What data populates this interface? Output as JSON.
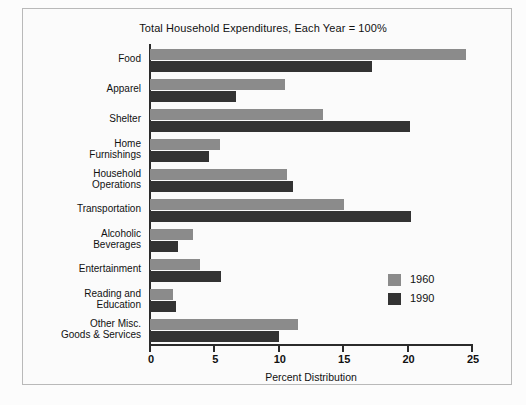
{
  "chart_data": {
    "type": "bar",
    "orientation": "horizontal",
    "title": "Total Household Expenditures, Each Year = 100%",
    "xlabel": "Percent Distribution",
    "ylabel": "",
    "xlim": [
      0,
      25
    ],
    "xticks": [
      0,
      5,
      10,
      15,
      20,
      25
    ],
    "xtick_labels": [
      "0",
      "5",
      "10",
      "15",
      "20",
      "25"
    ],
    "grid": false,
    "legend_position": "center-right",
    "categories": [
      "Food",
      "Apparel",
      "Shelter",
      "Home Furnishings",
      "Household Operations",
      "Transportation",
      "Alcoholic Beverages",
      "Entertainment",
      "Reading and Education",
      "Other Misc. Goods & Services"
    ],
    "category_lines": [
      [
        "Food"
      ],
      [
        "Apparel"
      ],
      [
        "Shelter"
      ],
      [
        "Home",
        "Furnishings"
      ],
      [
        "Household",
        "Operations"
      ],
      [
        "Transportation"
      ],
      [
        "Alcoholic",
        "Beverages"
      ],
      [
        "Entertainment"
      ],
      [
        "Reading and",
        "Education"
      ],
      [
        "Other Misc.",
        "Goods & Services"
      ]
    ],
    "series": [
      {
        "name": "1960",
        "color": "#8b8b8b",
        "values": [
          24.5,
          10.5,
          13.4,
          5.4,
          10.6,
          15.1,
          3.3,
          3.9,
          1.8,
          11.5
        ]
      },
      {
        "name": "1990",
        "color": "#333333",
        "values": [
          17.2,
          6.7,
          20.2,
          4.6,
          11.1,
          20.3,
          2.2,
          5.5,
          2.0,
          10.0
        ]
      }
    ]
  },
  "legend": {
    "items": [
      {
        "label": "1960",
        "color": "#8b8b8b"
      },
      {
        "label": "1990",
        "color": "#333333"
      }
    ]
  },
  "colors": {
    "series_1960": "#8b8b8b",
    "series_1990": "#333333",
    "axis": "#2b2b2b",
    "background": "#fbfbfb",
    "frame": "#b9b9b9",
    "text": "#111111"
  }
}
